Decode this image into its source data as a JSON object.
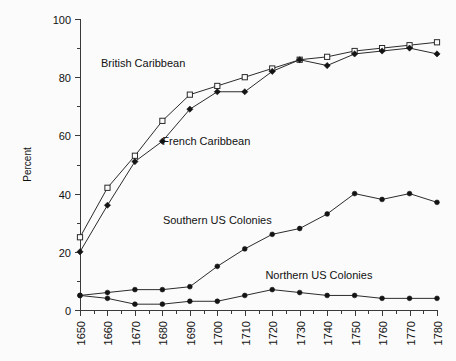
{
  "chart_data": {
    "type": "line",
    "title": "",
    "xlabel": "",
    "ylabel": "Percent",
    "xlim": [
      1650,
      1780
    ],
    "ylim": [
      0,
      100
    ],
    "ytick_step": 20,
    "yminor_step": 10,
    "xtick_step": 10,
    "xminor_step": 5,
    "grid": false,
    "legend_position": "inline-annotations",
    "x": [
      1650,
      1660,
      1670,
      1680,
      1690,
      1700,
      1710,
      1720,
      1730,
      1740,
      1750,
      1760,
      1770,
      1780
    ],
    "yticks": [
      0,
      20,
      40,
      60,
      80,
      100
    ],
    "xticks": [
      1650,
      1660,
      1670,
      1680,
      1690,
      1700,
      1710,
      1720,
      1730,
      1740,
      1750,
      1760,
      1770,
      1780
    ],
    "series": [
      {
        "name": "British Caribbean",
        "marker": "open-square",
        "values": [
          25,
          42,
          53,
          65,
          74,
          77,
          80,
          83,
          86,
          87,
          89,
          90,
          91,
          92
        ],
        "annotation": "British Caribbean",
        "annotation_x": 1673,
        "annotation_y": 85
      },
      {
        "name": "French Caribbean",
        "marker": "filled-diamond",
        "values": [
          20,
          36,
          51,
          58,
          69,
          75,
          75,
          82,
          86,
          84,
          88,
          89,
          90,
          88
        ],
        "annotation": "French Caribbean",
        "annotation_x": 1696,
        "annotation_y": 58
      },
      {
        "name": "Southern US Colonies",
        "marker": "filled-circle",
        "values": [
          5,
          6,
          7,
          7,
          8,
          15,
          21,
          26,
          28,
          33,
          40,
          38,
          40,
          37
        ],
        "annotation": "Southern US Colonies",
        "annotation_x": 1700,
        "annotation_y": 31
      },
      {
        "name": "Northern US Colonies",
        "marker": "filled-circle",
        "values": [
          5,
          4,
          2,
          2,
          3,
          3,
          5,
          7,
          6,
          5,
          5,
          4,
          4,
          4
        ],
        "annotation": "Northern US Colonies",
        "annotation_x": 1737,
        "annotation_y": 12
      }
    ]
  },
  "axes": {
    "y_axis_title": "Percent",
    "y_tick_labels": [
      "0",
      "20",
      "40",
      "60",
      "80",
      "100"
    ],
    "x_tick_labels": [
      "1650",
      "1660",
      "1670",
      "1680",
      "1690",
      "1700",
      "1710",
      "1720",
      "1730",
      "1740",
      "1750",
      "1760",
      "1770",
      "1780"
    ]
  },
  "colors": {
    "background": "#fbfbfb",
    "axis": "#3a3a3a",
    "line": "#2b2b2b",
    "marker_fill": "#141414",
    "text": "#111111"
  }
}
